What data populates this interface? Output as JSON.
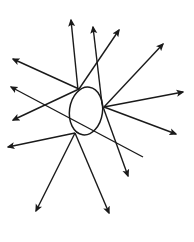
{
  "diagram": {
    "stroke_color": "#1a1a1a",
    "background": "#ffffff",
    "ellipse": {
      "cx": 86,
      "cy": 111,
      "rx": 16.5,
      "ry": 24,
      "rotate": 8
    },
    "arrows": [
      {
        "id": "a1",
        "x1": 78,
        "y1": 90,
        "x2": 71,
        "y2": 20
      },
      {
        "id": "a2",
        "x1": 102,
        "y1": 104,
        "x2": 93,
        "y2": 27
      },
      {
        "id": "a3",
        "x1": 79,
        "y1": 89,
        "x2": 119,
        "y2": 30
      },
      {
        "id": "a4",
        "x1": 79,
        "y1": 89,
        "x2": 13,
        "y2": 59
      },
      {
        "id": "a5",
        "x1": 79,
        "y1": 89,
        "x2": 13,
        "y2": 120
      },
      {
        "id": "a6",
        "x1": 143,
        "y1": 157,
        "x2": 11,
        "y2": 87
      },
      {
        "id": "a7",
        "x1": 104,
        "y1": 107,
        "x2": 163,
        "y2": 44
      },
      {
        "id": "a8",
        "x1": 104,
        "y1": 107,
        "x2": 183,
        "y2": 92
      },
      {
        "id": "a9",
        "x1": 104,
        "y1": 107,
        "x2": 176,
        "y2": 134
      },
      {
        "id": "a10",
        "x1": 102,
        "y1": 104,
        "x2": 128,
        "y2": 176
      },
      {
        "id": "a11",
        "x1": 75,
        "y1": 133,
        "x2": 8,
        "y2": 147
      },
      {
        "id": "a12",
        "x1": 75,
        "y1": 133,
        "x2": 36,
        "y2": 211
      },
      {
        "id": "a13",
        "x1": 75,
        "y1": 133,
        "x2": 109,
        "y2": 213
      }
    ]
  }
}
